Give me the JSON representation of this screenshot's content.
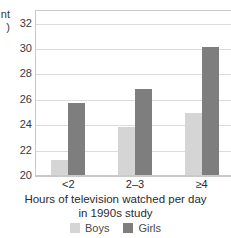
{
  "chart_data": {
    "type": "bar",
    "title": "",
    "categories": [
      "<2",
      "2–3",
      "≥4"
    ],
    "series": [
      {
        "name": "Boys",
        "color": "#d5d5d5",
        "values": [
          21.2,
          23.8,
          24.9
        ]
      },
      {
        "name": "Girls",
        "color": "#7e7e7e",
        "values": [
          25.7,
          26.8,
          30.1
        ]
      }
    ],
    "xlabel": "Hours of television watched per day in 1990s study",
    "xlabel_line1": "Hours of television watched per day",
    "xlabel_line2": "in 1990s study",
    "ylabel_clipped": "nt\n)",
    "ylim": [
      20,
      33
    ],
    "yticks": [
      20,
      22,
      24,
      26,
      28,
      30,
      32
    ],
    "ytick_labels": [
      "20",
      "22",
      "24",
      "26",
      "28",
      "30",
      "32"
    ],
    "grid": true,
    "grid_axis": "y",
    "legend_position": "bottom",
    "legend": [
      "Boys",
      "Girls"
    ]
  },
  "colors": {
    "boys": "#d5d5d5",
    "girls": "#7e7e7e",
    "grid": "#dcdcdc",
    "axis": "#c9c9c9",
    "text": "#2b2b2b"
  }
}
